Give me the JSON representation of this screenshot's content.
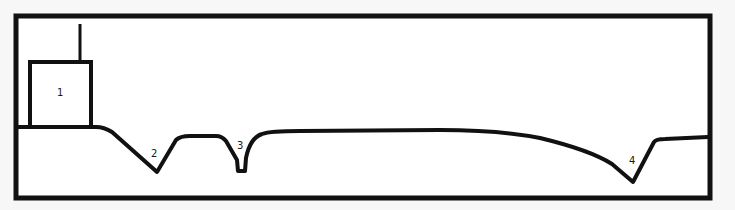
{
  "diagram": {
    "type": "cross-section profile",
    "colors": {
      "stroke": "#111111",
      "background": "#f7f7f7",
      "inner": "#ffffff"
    },
    "labels": [
      {
        "id": "1",
        "text": "1",
        "x": 59,
        "y": 95,
        "refers_to": "rectangular structure with vertical post"
      },
      {
        "id": "2",
        "text": "2",
        "x": 154,
        "y": 157,
        "refers_to": "V-shaped depression"
      },
      {
        "id": "3",
        "text": "3",
        "x": 240,
        "y": 149,
        "refers_to": "narrow flat-bottomed notch"
      },
      {
        "id": "4",
        "text": "4",
        "x": 632,
        "y": 163,
        "refers_to": "V-shaped depression"
      }
    ]
  }
}
